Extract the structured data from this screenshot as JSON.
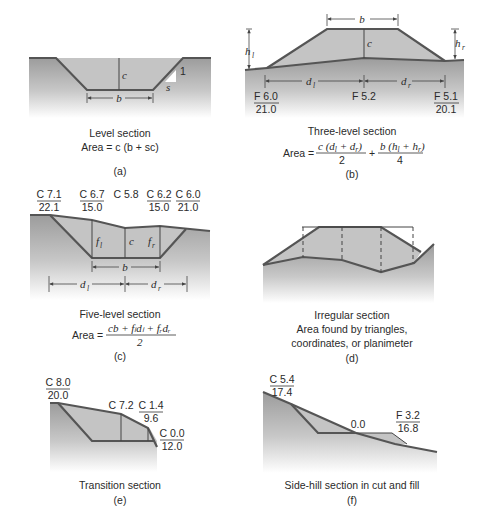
{
  "figure": {
    "panels": [
      {
        "id": "a",
        "caption": "Level section",
        "formula": "Area = c (b + sc)",
        "tag": "(a)",
        "labels": {
          "c": "c",
          "b": "b",
          "s": "s",
          "one": "1"
        }
      },
      {
        "id": "b",
        "caption": "Three-level section",
        "formula_prefix": "Area =",
        "formula_term1_num": "c (d",
        "formula_term1_num_tail": " + d",
        "formula_term1_den": "2",
        "formula_plus": "+",
        "formula_term2_num": "b (h",
        "formula_term2_num_tail": " + h",
        "formula_term2_den": "4",
        "tag": "(b)",
        "labels": {
          "b": "b",
          "c": "c",
          "h": "h",
          "d": "d",
          "sub_l": "l",
          "sub_r": "r"
        },
        "stations": [
          {
            "top": "F 6.0",
            "bottom": "21.0"
          },
          {
            "top": "F 5.2",
            "bottom": ""
          },
          {
            "top": "F 5.1",
            "bottom": "20.1"
          }
        ]
      },
      {
        "id": "c",
        "caption": "Five-level section",
        "formula_prefix": "Area =",
        "formula_num": "cb + fₗdₗ + fᵣdᵣ",
        "formula_den": "2",
        "tag": "(c)",
        "labels": {
          "f": "f",
          "c": "c",
          "b": "b",
          "d": "d",
          "sub_l": "l",
          "sub_r": "r"
        },
        "stations": [
          {
            "top": "C 7.1",
            "bottom": "22.1"
          },
          {
            "top": "C 6.7",
            "bottom": "15.0"
          },
          {
            "top": "C 5.8",
            "bottom": ""
          },
          {
            "top": "C 6.2",
            "bottom": "15.0"
          },
          {
            "top": "C 6.0",
            "bottom": "21.0"
          }
        ]
      },
      {
        "id": "d",
        "caption": "Irregular section",
        "caption_line2": "Area found by triangles,",
        "caption_line3": "coordinates, or planimeter",
        "tag": "(d)"
      },
      {
        "id": "e",
        "caption": "Transition section",
        "tag": "(e)",
        "stations": [
          {
            "top": "C 8.0",
            "bottom": "20.0"
          },
          {
            "top": "C 7.2",
            "bottom": ""
          },
          {
            "top": "C 1.4",
            "bottom": "9.6"
          },
          {
            "top": "C 0.0",
            "bottom": "12.0"
          }
        ]
      },
      {
        "id": "f",
        "caption": "Side-hill section in cut and fill",
        "tag": "(f)",
        "stations": [
          {
            "top": "C 5.4",
            "bottom": "17.4"
          },
          {
            "top": "0.0",
            "bottom": ""
          },
          {
            "top": "F 3.2",
            "bottom": "16.8"
          }
        ]
      }
    ],
    "colors": {
      "ground_top": "#9a9a9a",
      "ground_bottom": "#ffffff",
      "section_fill": "#c4c4c4",
      "edge": "#555555"
    }
  }
}
